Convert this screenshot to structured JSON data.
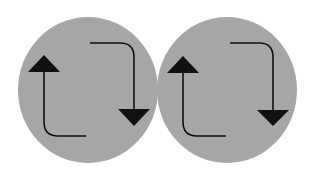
{
  "canvas": {
    "width": 316,
    "height": 177,
    "background": "#ffffff"
  },
  "colors": {
    "circle_fill": "#a6a6a6",
    "arrow": "#111111"
  },
  "icons": [
    {
      "name": "swap-arrows-icon",
      "offset_x": 0
    },
    {
      "name": "swap-arrows-icon",
      "offset_x": 139
    }
  ]
}
